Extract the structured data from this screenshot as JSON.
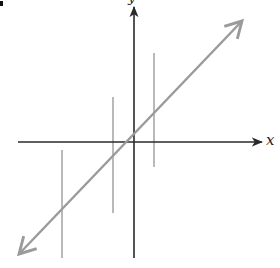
{
  "diagram": {
    "type": "coordinate-plane",
    "x_axis_label": "x",
    "y_axis_label": "y",
    "colors": {
      "axes": "#2a2a2a",
      "diagonal_line": "#9a9a9a",
      "vertical_lines": "#a8a8a8",
      "background": "#ffffff"
    },
    "axes": {
      "origin_px": [
        134,
        142
      ],
      "x_axis": {
        "from_px": [
          18,
          142
        ],
        "to_px": [
          263,
          142
        ],
        "arrow": "right"
      },
      "y_axis": {
        "from_px": [
          134,
          258
        ],
        "to_px": [
          134,
          6
        ],
        "arrow": "up"
      }
    },
    "diagonal_line": {
      "from_px": [
        18,
        255
      ],
      "to_px": [
        243,
        20
      ],
      "arrows": "both"
    },
    "vertical_lines": [
      {
        "x_px": 62,
        "y_top_px": 150,
        "y_bottom_px": 258
      },
      {
        "x_px": 113,
        "y_top_px": 97,
        "y_bottom_px": 213
      },
      {
        "x_px": 154,
        "y_top_px": 53,
        "y_bottom_px": 167
      }
    ]
  }
}
